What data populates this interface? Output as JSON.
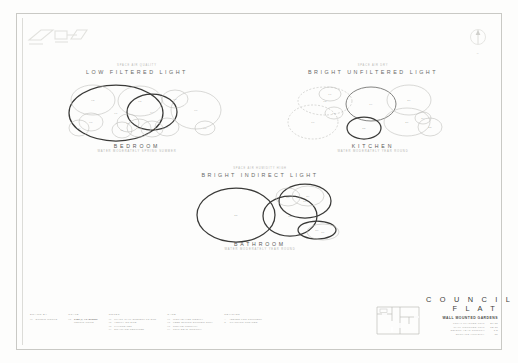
{
  "sheet": {
    "logo_name": "studio-logo",
    "north_mark_label": "N"
  },
  "zones": [
    {
      "id": "bedroom",
      "eyebrow": "SPACE AIR QUALITY",
      "light_title": "LOW FILTERED LIGHT",
      "name": "BEDROOM",
      "care_note": "WATER MODERATELY SPRING SUMMER"
    },
    {
      "id": "kitchen",
      "eyebrow": "SPACE AIR DRY",
      "light_title": "BRIGHT UNFILTERED LIGHT",
      "name": "KITCHEN",
      "care_note": "WATER MODERATELY YEAR ROUND"
    },
    {
      "id": "bathroom",
      "eyebrow": "SPACE AIR HUMIDITY HIGH",
      "light_title": "BRIGHT INDIRECT LIGHT",
      "name": "BATHROOM",
      "care_note": "WATER MODERATELY YEAR ROUND"
    }
  ],
  "titleblock": {
    "plan_name": "flat-floor-plan",
    "title_line_1": "C O U N C I L",
    "title_line_2": "F L A T",
    "subtitle": "WALL MOUNTED GARDENS",
    "rows": [
      {
        "label": "TOTAL PLANTED UNIT",
        "value": "24.80"
      },
      {
        "label": "WALL MOUNTED UNIT",
        "value": "12.10"
      },
      {
        "label": "SELECT YEAR GROWTH",
        "value": "7.5"
      },
      {
        "label": "SURFACE HUMIDITY",
        "value": "86"
      }
    ]
  },
  "legend": {
    "columns": [
      {
        "head": "DRAWN BY",
        "rows": [
          {
            "key": "01",
            "value": "STUDIO WORKS",
            "bold": false
          }
        ]
      },
      {
        "head": "SCALE",
        "rows": [
          {
            "key": "02",
            "value": "1:50 @ A1 SHEET",
            "bold": true
          },
          {
            "key": "",
            "value": "METRIC UNITS",
            "bold": false
          }
        ]
      },
      {
        "head": "NOTES",
        "rows": [
          {
            "key": "01",
            "value": "PLANT WALL SUBJECT TO SUN",
            "bold": false
          },
          {
            "key": "02",
            "value": "VERIFY ON SITE",
            "bold": false
          },
          {
            "key": "03",
            "value": "FIXINGS TBC",
            "bold": false
          },
          {
            "key": "04",
            "value": "DRAINAGE REQUIRED",
            "bold": false
          }
        ]
      },
      {
        "head": "CARE",
        "rows": [
          {
            "key": "01",
            "value": "MIST LEAVES WEEKLY",
            "bold": false
          },
          {
            "key": "02",
            "value": "FEED SPRING SUMMER ONLY",
            "bold": false
          },
          {
            "key": "03",
            "value": "ROTATE MONTHLY",
            "bold": false
          },
          {
            "key": "04",
            "value": "TRIM DEAD GROWTH",
            "bold": false
          }
        ]
      },
      {
        "head": "REVISION",
        "rows": [
          {
            "key": "A",
            "value": "ISSUED FOR COMMENT",
            "bold": false
          },
          {
            "key": "B",
            "value": "PLANTING UPDATED",
            "bold": false
          }
        ]
      }
    ]
  },
  "chart_data": {
    "type": "scatter",
    "xlabel": "",
    "ylabel": "",
    "note": "Each circle is a planted unit plotted as an overlapping canopy spread diagram; radius encodes canopy size, stroke weight encodes proposed vs existing.",
    "groups": [
      {
        "name": "BEDROOM",
        "light": "LOW FILTERED LIGHT",
        "circles": [
          {
            "cx": 116,
            "cy": 113,
            "rx": 47,
            "ry": 28,
            "weight": "heavy",
            "style": "solid",
            "label": "01"
          },
          {
            "cx": 93,
            "cy": 100,
            "rx": 22,
            "ry": 15,
            "weight": "light",
            "style": "solid",
            "label": "02"
          },
          {
            "cx": 140,
            "cy": 101,
            "rx": 22,
            "ry": 15,
            "weight": "light",
            "style": "solid",
            "label": "03"
          },
          {
            "cx": 152,
            "cy": 112,
            "rx": 25,
            "ry": 18,
            "weight": "heavy",
            "style": "solid",
            "label": "04"
          },
          {
            "cx": 175,
            "cy": 99,
            "rx": 13,
            "ry": 9,
            "weight": "light",
            "style": "solid",
            "label": "05"
          },
          {
            "cx": 196,
            "cy": 110,
            "rx": 25,
            "ry": 19,
            "weight": "light",
            "style": "solid",
            "label": "06"
          },
          {
            "cx": 205,
            "cy": 128,
            "rx": 10,
            "ry": 7,
            "weight": "light",
            "style": "solid",
            "label": "07"
          },
          {
            "cx": 91,
            "cy": 122,
            "rx": 12,
            "ry": 9,
            "weight": "light",
            "style": "solid",
            "label": "08"
          },
          {
            "cx": 79,
            "cy": 128,
            "rx": 10,
            "ry": 8,
            "weight": "light",
            "style": "solid",
            "label": "09"
          },
          {
            "cx": 128,
            "cy": 123,
            "rx": 11,
            "ry": 9,
            "weight": "light",
            "style": "solid",
            "label": "10"
          },
          {
            "cx": 122,
            "cy": 130,
            "rx": 10,
            "ry": 8,
            "weight": "light",
            "style": "solid",
            "label": "11"
          },
          {
            "cx": 139,
            "cy": 128,
            "rx": 12,
            "ry": 9,
            "weight": "light",
            "style": "solid",
            "label": "12"
          },
          {
            "cx": 152,
            "cy": 129,
            "rx": 11,
            "ry": 8,
            "weight": "light",
            "style": "solid",
            "label": "13"
          },
          {
            "cx": 167,
            "cy": 127,
            "rx": 12,
            "ry": 9,
            "weight": "light",
            "style": "solid",
            "label": "14"
          }
        ]
      },
      {
        "name": "KITCHEN",
        "light": "BRIGHT UNFILTERED LIGHT",
        "circles": [
          {
            "cx": 325,
            "cy": 101,
            "rx": 27,
            "ry": 14,
            "weight": "light",
            "style": "dashed",
            "label": "15"
          },
          {
            "cx": 313,
            "cy": 122,
            "rx": 25,
            "ry": 17,
            "weight": "light",
            "style": "dashed",
            "label": "16"
          },
          {
            "cx": 330,
            "cy": 94,
            "rx": 11,
            "ry": 7,
            "weight": "light",
            "style": "solid",
            "label": "17"
          },
          {
            "cx": 334,
            "cy": 113,
            "rx": 9,
            "ry": 6,
            "weight": "light",
            "style": "solid",
            "label": "18"
          },
          {
            "cx": 371,
            "cy": 104,
            "rx": 25,
            "ry": 17,
            "weight": "medium",
            "style": "solid",
            "label": "19"
          },
          {
            "cx": 409,
            "cy": 100,
            "rx": 22,
            "ry": 15,
            "weight": "light",
            "style": "solid",
            "label": "20"
          },
          {
            "cx": 407,
            "cy": 122,
            "rx": 23,
            "ry": 14,
            "weight": "light",
            "style": "solid",
            "label": "21"
          },
          {
            "cx": 364,
            "cy": 128,
            "rx": 17,
            "ry": 11,
            "weight": "heavy",
            "style": "solid",
            "label": "22"
          },
          {
            "cx": 430,
            "cy": 127,
            "rx": 12,
            "ry": 9,
            "weight": "light",
            "style": "solid",
            "label": "23"
          },
          {
            "cx": 423,
            "cy": 118,
            "rx": 8,
            "ry": 6,
            "weight": "light",
            "style": "solid",
            "label": "24"
          }
        ]
      },
      {
        "name": "BATHROOM",
        "light": "BRIGHT INDIRECT LIGHT",
        "circles": [
          {
            "cx": 236,
            "cy": 215,
            "rx": 39,
            "ry": 27,
            "weight": "heavy",
            "style": "solid",
            "label": "25"
          },
          {
            "cx": 290,
            "cy": 216,
            "rx": 27,
            "ry": 20,
            "weight": "heavy",
            "style": "solid",
            "label": "26"
          },
          {
            "cx": 305,
            "cy": 201,
            "rx": 26,
            "ry": 17,
            "weight": "heavy",
            "style": "solid",
            "label": "27"
          },
          {
            "cx": 288,
            "cy": 197,
            "rx": 12,
            "ry": 9,
            "weight": "light",
            "style": "solid",
            "label": "28"
          },
          {
            "cx": 308,
            "cy": 196,
            "rx": 16,
            "ry": 10,
            "weight": "light",
            "style": "solid",
            "label": "29"
          },
          {
            "cx": 317,
            "cy": 230,
            "rx": 19,
            "ry": 9,
            "weight": "heavy",
            "style": "solid",
            "label": "30"
          },
          {
            "cx": 323,
            "cy": 232,
            "rx": 16,
            "ry": 8,
            "weight": "light",
            "style": "solid",
            "label": "31"
          }
        ]
      }
    ]
  }
}
